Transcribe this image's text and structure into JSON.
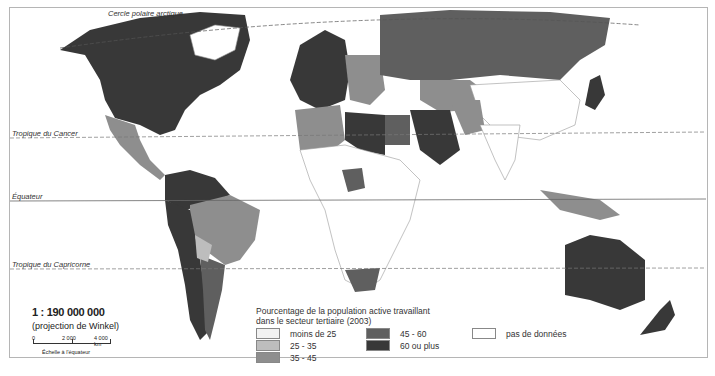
{
  "map": {
    "latitude_lines": {
      "arctic_circle": "Cercle polaire arctique",
      "tropic_cancer": "Tropique du Cancer",
      "equator": "Équateur",
      "tropic_capricorn": "Tropique du Capricorne"
    }
  },
  "scale": {
    "ratio": "1 : 190 000 000",
    "projection": "(projection de Winkel)",
    "ticks": [
      "0",
      "2 000",
      "4 000 km"
    ],
    "caption": "Échelle à l'équateur"
  },
  "legend": {
    "title_line1": "Pourcentage de la population active travaillant",
    "title_line2": "dans le secteur tertiaire (2003)",
    "items": [
      {
        "label": "moins de 25",
        "color": "#f2f2f2"
      },
      {
        "label": "25 - 35",
        "color": "#bdbdbd"
      },
      {
        "label": "35 - 45",
        "color": "#8e8e8e"
      },
      {
        "label": "45 - 60",
        "color": "#5f5f5f"
      },
      {
        "label": "60 ou plus",
        "color": "#383838"
      },
      {
        "label": "pas de données",
        "color": "#ffffff"
      }
    ]
  }
}
